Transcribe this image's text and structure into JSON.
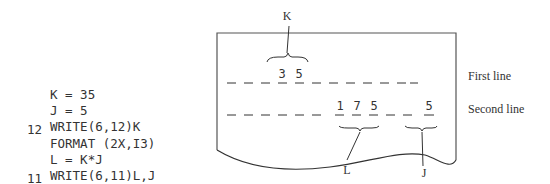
{
  "code": {
    "lines": [
      {
        "label": "",
        "stmt": "K = 35"
      },
      {
        "label": "",
        "stmt": "J = 5"
      },
      {
        "label": "",
        "stmt": "WRITE(6,12)K"
      },
      {
        "label": "12",
        "stmt": "FORMAT (2X,I3)"
      },
      {
        "label": "",
        "stmt": "L = K*J"
      },
      {
        "label": "",
        "stmt": "WRITE(6,11)L,J"
      },
      {
        "label": "11",
        "stmt": "FORMAT(6X,I3,1X,I2)"
      }
    ]
  },
  "printout": {
    "first_line": {
      "digits": [
        "3",
        "5"
      ],
      "label": "First line",
      "variable": "K"
    },
    "second_line": {
      "digits_L": [
        "1",
        "7",
        "5"
      ],
      "digits_J": [
        "5"
      ],
      "label": "Second line",
      "variable_L": "L",
      "variable_J": "J"
    }
  },
  "colors": {
    "ink": "#333333",
    "background": "#ffffff"
  }
}
